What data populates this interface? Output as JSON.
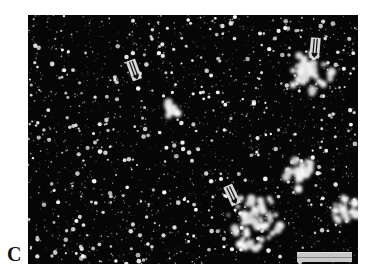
{
  "figure": {
    "panel_label": "C",
    "background_color": "#ffffff",
    "micrograph": {
      "description": "dark-field micrograph with bright scattered particles and clusters",
      "background_color": "#060606",
      "particle_color": "#ffffff",
      "bright_clusters": [
        {
          "x": 310,
          "y": 72,
          "r": 22
        },
        {
          "x": 255,
          "y": 222,
          "r": 28
        },
        {
          "x": 300,
          "y": 175,
          "r": 16
        },
        {
          "x": 170,
          "y": 108,
          "r": 10
        },
        {
          "x": 345,
          "y": 210,
          "r": 14
        }
      ]
    },
    "arrows": [
      {
        "name": "double-arrow-upper-left",
        "x": 134,
        "y": 70,
        "angle": -20
      },
      {
        "name": "double-arrow-upper-right",
        "x": 315,
        "y": 48,
        "angle": 5
      },
      {
        "name": "double-arrow-lower-middle",
        "x": 232,
        "y": 195,
        "angle": -25
      }
    ],
    "scale_bar": {
      "label": "",
      "color": "#c9c9c9"
    }
  }
}
